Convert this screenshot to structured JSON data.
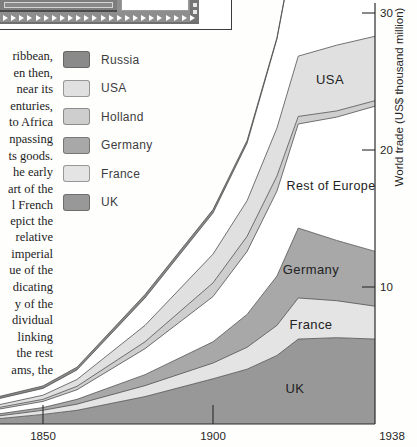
{
  "left_text": {
    "para1_lines": [
      "ribbean,",
      "en then,",
      "near its",
      "enturies,",
      "to Africa",
      "npassing",
      "ts goods.",
      "he early",
      "art of the",
      "l French"
    ],
    "para2_lines": [
      "epict the",
      "relative",
      "imperial",
      "ue of the",
      "dicating",
      "y of the",
      "dividual",
      "linking",
      "the rest",
      "ams, the"
    ]
  },
  "legend": {
    "items": [
      {
        "label": "Russia",
        "color": "#8a8a8a"
      },
      {
        "label": "USA",
        "color": "#e0e0e0"
      },
      {
        "label": "Holland",
        "color": "#cecece"
      },
      {
        "label": "Germany",
        "color": "#a8a8a8"
      },
      {
        "label": "France",
        "color": "#e4e4e4"
      },
      {
        "label": "UK",
        "color": "#989898"
      }
    ]
  },
  "chart_data": {
    "type": "area",
    "stacked": true,
    "title": "",
    "xlabel": "",
    "ylabel": "World trade (US$ thousand million)",
    "x": [
      1840,
      1850,
      1860,
      1880,
      1900,
      1908,
      1915,
      1920,
      1929,
      1938
    ],
    "series": [
      {
        "name": "UK",
        "color": "#989898",
        "values": [
          0.4,
          0.7,
          1.0,
          2.0,
          3.3,
          4.0,
          5.0,
          6.2,
          6.3,
          6.2
        ]
      },
      {
        "name": "France",
        "color": "#e4e4e4",
        "values": [
          0.2,
          0.3,
          0.45,
          0.8,
          1.15,
          1.6,
          2.2,
          3.0,
          2.7,
          2.4
        ]
      },
      {
        "name": "Germany",
        "color": "#a8a8a8",
        "values": [
          0.15,
          0.2,
          0.35,
          0.8,
          1.55,
          2.4,
          3.6,
          5.1,
          4.4,
          4.0
        ]
      },
      {
        "name": "Rest of Europe",
        "color": "#ffffff",
        "values": [
          0.35,
          0.45,
          0.7,
          1.9,
          3.3,
          4.6,
          6.2,
          7.6,
          9.0,
          10.6
        ]
      },
      {
        "name": "Holland",
        "color": "#cecece",
        "values": [
          0.12,
          0.15,
          0.25,
          0.5,
          1.0,
          1.1,
          1.1,
          0.55,
          0.45,
          0.4
        ]
      },
      {
        "name": "USA",
        "color": "#e0e0e0",
        "values": [
          0.2,
          0.3,
          0.5,
          1.2,
          2.1,
          2.6,
          3.5,
          4.4,
          4.8,
          4.7
        ]
      },
      {
        "name": "",
        "color": "#ffffff",
        "values": [
          0.45,
          0.5,
          0.7,
          2.0,
          3.0,
          4.2,
          6.5,
          9.5,
          11.0,
          12.0
        ]
      },
      {
        "name": "Russia",
        "color": "#8a8a8a",
        "values": [
          0.15,
          0.18,
          0.2,
          0.25,
          0.25,
          0.2,
          0.1,
          0.06,
          0.06,
          0.06
        ]
      }
    ],
    "y_ticks": [
      10,
      20,
      30
    ],
    "ylim": [
      0,
      31
    ],
    "grid": false,
    "legend_position": "outside-left",
    "x_ticks": [
      {
        "label": "1850",
        "year": 1850,
        "has_mark": true
      },
      {
        "label": "1900",
        "year": 1900,
        "has_mark": true
      },
      {
        "label": "1938",
        "year": 1938,
        "has_mark": false,
        "x_px": 392
      }
    ],
    "area_labels": [
      {
        "text": "USA",
        "x": 330,
        "y": 84,
        "size": 13
      },
      {
        "text": "Rest of Europe",
        "x": 331,
        "y": 190,
        "size": 12.5
      },
      {
        "text": "Germany",
        "x": 311,
        "y": 274,
        "size": 13
      },
      {
        "text": "France",
        "x": 311,
        "y": 329,
        "size": 13
      },
      {
        "text": "UK",
        "x": 295,
        "y": 393,
        "size": 13
      }
    ],
    "layout": {
      "width": 417,
      "height": 447,
      "year_anchors": [
        [
          1840,
          0
        ],
        [
          1850,
          43
        ],
        [
          1900,
          213
        ],
        [
          1938,
          375
        ]
      ],
      "zero_y_px": 424,
      "px_per_unit": 13.7,
      "axis_x_px": 375,
      "stroke": "#4f4f4f",
      "axis_color": "#2b2b2b",
      "text_color": "#262626"
    }
  }
}
